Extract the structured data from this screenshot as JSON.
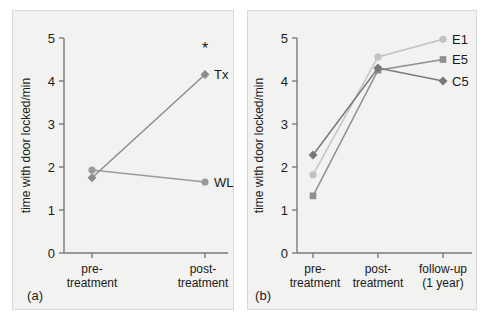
{
  "figure": {
    "panels": [
      {
        "key": "a",
        "label": "(a)",
        "ylabel": "time with door locked/min",
        "annotation": "*"
      },
      {
        "key": "b",
        "label": "(b)",
        "ylabel": "time with door locked/min"
      }
    ]
  },
  "chart_data": [
    {
      "type": "line",
      "panel": "a",
      "title": "",
      "xlabel": "",
      "ylabel": "time with door locked/min",
      "categories": [
        "pre-treatment",
        "post-treatment"
      ],
      "category_lines": [
        [
          "pre-",
          "treatment"
        ],
        [
          "post-",
          "treatment"
        ]
      ],
      "ylim": [
        0,
        5
      ],
      "yticks": [
        0,
        1,
        2,
        3,
        4,
        5
      ],
      "yticklabels": [
        "0",
        "1",
        "2",
        "3",
        "4",
        "5"
      ],
      "grid": false,
      "legend_position": "inline-right",
      "annotations": [
        {
          "text": "*",
          "x_category": "post-treatment",
          "y": 4.62
        }
      ],
      "series": [
        {
          "name": "Tx",
          "values": [
            1.75,
            4.15
          ],
          "color": "#8c8c8c",
          "marker": "diamond",
          "label": "Tx"
        },
        {
          "name": "WL",
          "values": [
            1.93,
            1.65
          ],
          "color": "#9a9a9a",
          "marker": "circle",
          "label": "WL"
        }
      ]
    },
    {
      "type": "line",
      "panel": "b",
      "title": "",
      "xlabel": "",
      "ylabel": "time with door locked/min",
      "categories": [
        "pre-treatment",
        "post-treatment",
        "follow-up (1 year)"
      ],
      "category_lines": [
        [
          "pre-",
          "treatment"
        ],
        [
          "post-",
          "treatment"
        ],
        [
          "follow-up",
          "(1 year)"
        ]
      ],
      "ylim": [
        0,
        5
      ],
      "yticks": [
        0,
        1,
        2,
        3,
        4,
        5
      ],
      "yticklabels": [
        "0",
        "1",
        "2",
        "3",
        "4",
        "5"
      ],
      "grid": false,
      "legend_position": "inline-right",
      "series": [
        {
          "name": "E1",
          "values": [
            1.82,
            4.56,
            4.97
          ],
          "color": "#c2c2c2",
          "marker": "circle",
          "label": "E1"
        },
        {
          "name": "E5",
          "values": [
            1.33,
            4.25,
            4.5
          ],
          "color": "#8f8f8f",
          "marker": "square",
          "label": "E5"
        },
        {
          "name": "C5",
          "values": [
            2.28,
            4.3,
            4.0
          ],
          "color": "#787878",
          "marker": "diamond",
          "label": "C5"
        }
      ]
    }
  ]
}
